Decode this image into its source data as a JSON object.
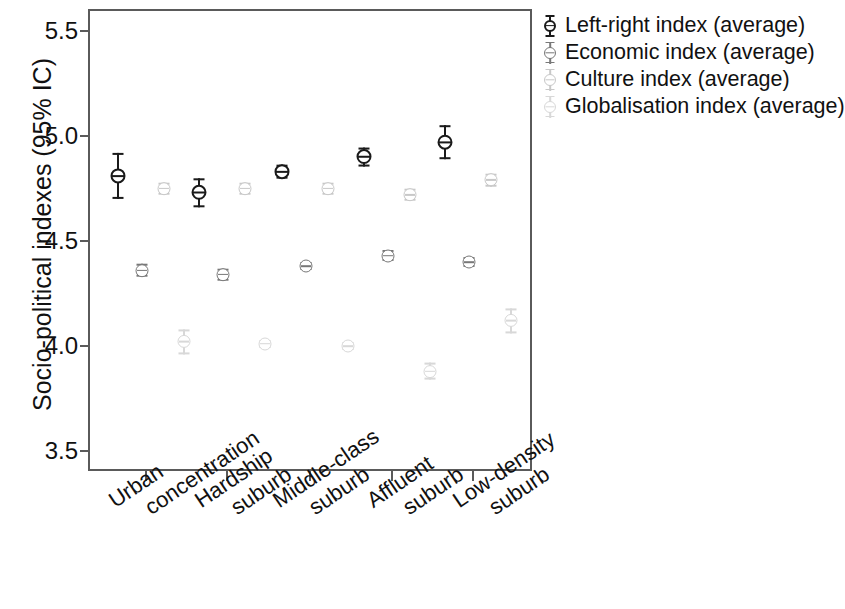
{
  "chart_data": {
    "type": "scatter",
    "title": "",
    "subtitle": "",
    "xlabel": "",
    "ylabel": "Socio-political indexes (95% IC)",
    "ylim": [
      3.5,
      5.5
    ],
    "yticks": [
      5.5,
      5.0,
      4.5,
      4.0,
      3.5
    ],
    "ytick_labels": [
      "5.5",
      "5.0",
      "4.5",
      "4.0",
      "3.5"
    ],
    "grid": false,
    "legend_position": "top-right",
    "error_bars": "95% confidence interval",
    "categories": [
      "Urban concentration",
      "Hardship suburb",
      "Middle-class suburb",
      "Affluent suburb",
      "Low-density suburb"
    ],
    "category_lines": [
      [
        "Urban",
        "concentration"
      ],
      [
        "Hardship",
        "suburb"
      ],
      [
        "Middle-class",
        "suburb"
      ],
      [
        "Affluent",
        "suburb"
      ],
      [
        "Low-density",
        "suburb"
      ]
    ],
    "series": [
      {
        "name": "Left-right index (average)",
        "color": "#1a1a1a",
        "values": [
          4.81,
          4.73,
          4.83,
          4.9,
          4.97
        ],
        "err_low": [
          4.7,
          4.66,
          4.8,
          4.86,
          4.89
        ],
        "err_high": [
          4.92,
          4.8,
          4.87,
          4.95,
          5.05
        ]
      },
      {
        "name": "Economic index (average)",
        "color": "#787878",
        "values": [
          4.36,
          4.34,
          4.38,
          4.43,
          4.4
        ],
        "err_low": [
          4.33,
          4.31,
          4.36,
          4.41,
          4.38
        ],
        "err_high": [
          4.39,
          4.37,
          4.4,
          4.46,
          4.43
        ]
      },
      {
        "name": "Culture index (average)",
        "color": "#c8c8c8",
        "values": [
          4.75,
          4.75,
          4.75,
          4.72,
          4.79
        ],
        "err_low": [
          4.72,
          4.72,
          4.72,
          4.69,
          4.76
        ],
        "err_high": [
          4.78,
          4.78,
          4.78,
          4.75,
          4.82
        ]
      },
      {
        "name": "Globalisation index (average)",
        "color": "#d8d8d8",
        "values": [
          4.02,
          4.01,
          4.0,
          3.88,
          4.12
        ],
        "err_low": [
          3.96,
          3.99,
          3.98,
          3.84,
          4.06
        ],
        "err_high": [
          4.08,
          4.03,
          4.02,
          3.92,
          4.18
        ]
      }
    ]
  },
  "legend": {
    "items": [
      "Left-right index (average)",
      "Economic index (average)",
      "Culture index (average)",
      "Globalisation index (average)"
    ]
  },
  "axes": {
    "y_title": "Socio-political indexes (95% IC)"
  }
}
